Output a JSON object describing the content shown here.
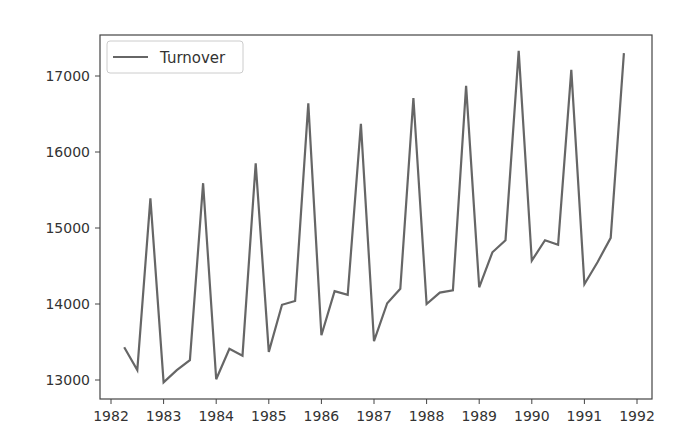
{
  "chart_data": {
    "type": "line",
    "title": "",
    "xlabel": "",
    "ylabel": "",
    "xlim": [
      1981.8,
      1992.3
    ],
    "ylim": [
      12730,
      17550
    ],
    "grid": false,
    "legend_position": "upper left",
    "x_ticks": [
      1982,
      1983,
      1984,
      1985,
      1986,
      1987,
      1988,
      1989,
      1990,
      1991,
      1992
    ],
    "y_ticks": [
      13000,
      14000,
      15000,
      16000,
      17000
    ],
    "series": [
      {
        "name": "Turnover",
        "color": "#666666",
        "x": [
          1982.25,
          1982.5,
          1982.75,
          1983.0,
          1983.25,
          1983.5,
          1983.75,
          1984.0,
          1984.25,
          1984.5,
          1984.75,
          1985.0,
          1985.25,
          1985.5,
          1985.75,
          1986.0,
          1986.25,
          1986.5,
          1986.75,
          1987.0,
          1987.25,
          1987.5,
          1987.75,
          1988.0,
          1988.25,
          1988.5,
          1988.75,
          1989.0,
          1989.25,
          1989.5,
          1989.75,
          1990.0,
          1990.25,
          1990.5,
          1990.75,
          1991.0,
          1991.25,
          1991.5,
          1991.75
        ],
        "values": [
          13430,
          13130,
          15390,
          12970,
          13130,
          13260,
          15590,
          13010,
          13410,
          13320,
          15850,
          13370,
          13990,
          14040,
          16640,
          13590,
          14170,
          14120,
          16370,
          13510,
          14010,
          14200,
          16710,
          14000,
          14150,
          14180,
          16870,
          14220,
          14680,
          14840,
          17330,
          14570,
          14840,
          14780,
          17080,
          14260,
          14550,
          14870,
          17300
        ]
      }
    ]
  },
  "legend": {
    "items": [
      {
        "label": "Turnover",
        "color": "#666666"
      }
    ]
  },
  "axes": {
    "frame_color": "#444444",
    "background": "#ffffff"
  }
}
